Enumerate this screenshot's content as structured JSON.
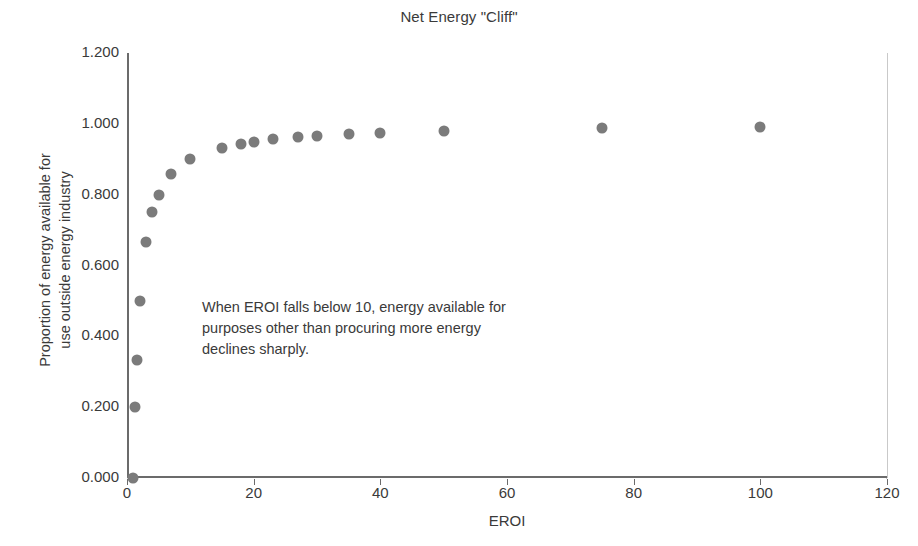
{
  "chart_data": {
    "type": "scatter",
    "title": "Net Energy \"Cliff\"",
    "xlabel": "EROI",
    "ylabel_line1": "Proportion of energy available for",
    "ylabel_line2": "use outside energy industry",
    "xlim": [
      0,
      120
    ],
    "ylim": [
      0.0,
      1.2
    ],
    "xticks": [
      0,
      20,
      40,
      60,
      80,
      100,
      120
    ],
    "xtick_labels": [
      "0",
      "20",
      "40",
      "60",
      "80",
      "100",
      "120"
    ],
    "yticks": [
      0.0,
      0.2,
      0.4,
      0.6,
      0.8,
      1.0,
      1.2
    ],
    "ytick_labels": [
      "0.000",
      "0.200",
      "0.400",
      "0.600",
      "0.800",
      "1.000",
      "1.200"
    ],
    "grid": true,
    "legend": "none",
    "marker_color": "#7b7b7b",
    "shaded_region": {
      "label": "cliff-zone",
      "x_start": 0,
      "x_end": 10,
      "y_start": 0.0,
      "y_end": 1.0,
      "fill_color": "#dedede",
      "border_color": "#6b6b6b"
    },
    "annotation": {
      "line1": "When EROI falls below 10, energy available for",
      "line2": "purposes other than procuring more energy",
      "line3": "declines sharply."
    },
    "points": [
      {
        "x": 1,
        "y": 0.0
      },
      {
        "x": 1.25,
        "y": 0.2
      },
      {
        "x": 1.5,
        "y": 0.333
      },
      {
        "x": 2,
        "y": 0.5
      },
      {
        "x": 3,
        "y": 0.667
      },
      {
        "x": 4,
        "y": 0.75
      },
      {
        "x": 5,
        "y": 0.8
      },
      {
        "x": 7,
        "y": 0.857
      },
      {
        "x": 10,
        "y": 0.9
      },
      {
        "x": 15,
        "y": 0.933
      },
      {
        "x": 18,
        "y": 0.944
      },
      {
        "x": 20,
        "y": 0.95
      },
      {
        "x": 23,
        "y": 0.957
      },
      {
        "x": 27,
        "y": 0.963
      },
      {
        "x": 30,
        "y": 0.967
      },
      {
        "x": 35,
        "y": 0.971
      },
      {
        "x": 40,
        "y": 0.975
      },
      {
        "x": 50,
        "y": 0.98
      },
      {
        "x": 75,
        "y": 0.987
      },
      {
        "x": 100,
        "y": 0.99
      }
    ]
  }
}
